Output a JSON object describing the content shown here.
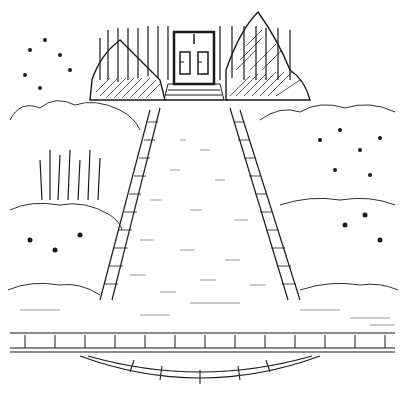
{
  "illustration": {
    "subject": "Garden path leading to a house door",
    "style": "black ink line drawing on white",
    "colors": {
      "ink": "#1a1a1a",
      "paper": "#ffffff",
      "light_ink": "#555555"
    },
    "elements": [
      {
        "name": "house-facade",
        "desc": "vertical-lined wall with double door"
      },
      {
        "name": "front-door",
        "desc": "double door with two panels"
      },
      {
        "name": "entry-steps",
        "desc": "three steps below the door"
      },
      {
        "name": "hedges",
        "desc": "hatched conical shrubs flanking door"
      },
      {
        "name": "central-path",
        "desc": "perspective path through garden"
      },
      {
        "name": "brick-edging",
        "desc": "brick borders along both sides of path"
      },
      {
        "name": "flower-beds",
        "desc": "shrubs and flowers left and right"
      },
      {
        "name": "lawn",
        "desc": "grass strokes in foreground"
      },
      {
        "name": "stone-curb",
        "desc": "horizontal paver curb across foreground"
      },
      {
        "name": "curved-step",
        "desc": "semicircular stone step at bottom"
      }
    ]
  }
}
